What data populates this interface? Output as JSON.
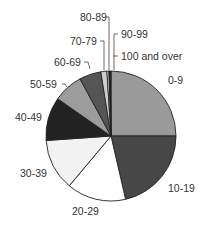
{
  "chart_data": {
    "type": "pie",
    "title": "",
    "start_angle": "12 o'clock",
    "direction": "clockwise",
    "categories": [
      "0-9",
      "10-19",
      "20-29",
      "30-39",
      "40-49",
      "50-59",
      "60-69",
      "70-79",
      "80-89",
      "90-99",
      "100 and over"
    ],
    "values": [
      25.0,
      21.4,
      14.7,
      12.8,
      10.8,
      7.4,
      5.4,
      1.5,
      0.5,
      0.3,
      0.2
    ],
    "colors": [
      "#9a9a9a",
      "#474747",
      "#ffffff",
      "#f2f2f2",
      "#222222",
      "#9c9c9c",
      "#555555",
      "#cfcfcf",
      "#f0f0f0",
      "#111111",
      "#333333"
    ],
    "legend": "none",
    "labels_with_leaders": [
      "70-79",
      "80-89",
      "90-99",
      "100 and over",
      "60-69",
      "50-59"
    ]
  }
}
